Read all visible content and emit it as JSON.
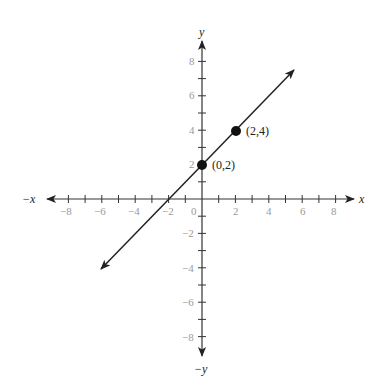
{
  "chart_data": {
    "type": "line",
    "title": "",
    "xlabel": "x",
    "ylabel": "y",
    "xlabel_neg": "−x",
    "ylabel_neg": "−y",
    "xlim": [
      -9,
      9
    ],
    "ylim": [
      -9,
      9
    ],
    "grid": false,
    "x_ticks": [
      -8,
      -7,
      -6,
      -5,
      -4,
      -3,
      -2,
      -1,
      1,
      2,
      3,
      4,
      5,
      6,
      7,
      8
    ],
    "y_ticks": [
      -8,
      -7,
      -6,
      -5,
      -4,
      -3,
      -2,
      -1,
      1,
      2,
      3,
      4,
      5,
      6,
      7,
      8
    ],
    "x_tick_labels": [
      "−8",
      "−6",
      "−4",
      "−2",
      "0",
      "2",
      "4",
      "6",
      "8"
    ],
    "y_tick_labels": [
      "8",
      "6",
      "4",
      "2",
      "−2",
      "−4",
      "−6",
      "−8"
    ],
    "series": [
      {
        "name": "line",
        "equation": "y = x + 2",
        "slope": 1,
        "intercept": 2,
        "x": [
          -6,
          5.5
        ],
        "y": [
          -4,
          7.5
        ],
        "arrows": "both"
      }
    ],
    "points": [
      {
        "x": 0,
        "y": 2,
        "label": "(0,2)"
      },
      {
        "x": 2,
        "y": 4,
        "label": "(2,4)"
      }
    ]
  },
  "labels": {
    "x_pos": "x",
    "x_neg": "−x",
    "y_pos": "y",
    "y_neg": "−y",
    "origin": "0",
    "point1": "(0,2)",
    "point2": "(2,4)",
    "xt_m8": "−8",
    "xt_m6": "−6",
    "xt_m4": "−4",
    "xt_m2": "−2",
    "xt_2": "2",
    "xt_4": "4",
    "xt_6": "6",
    "xt_8": "8",
    "yt_8": "8",
    "yt_6": "6",
    "yt_4": "4",
    "yt_2": "2",
    "yt_m2": "−2",
    "yt_m4": "−4",
    "yt_m6": "−6",
    "yt_m8": "−8"
  }
}
